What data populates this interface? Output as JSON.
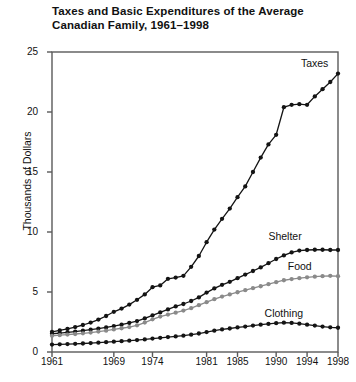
{
  "chart_data": {
    "type": "line",
    "title": "Taxes and Basic Expenditures of the Average Canadian Family, 1961–1998",
    "title_line1": "Taxes and Basic Expenditures of the Average",
    "title_line2": "Canadian Family, 1961–1998",
    "xlabel": "",
    "ylabel": "Thousands of Dollars",
    "ylim": [
      0,
      25
    ],
    "yticks": [
      0,
      5,
      10,
      15,
      20,
      25
    ],
    "xlim": [
      1961,
      1998
    ],
    "xticks": [
      1961,
      1969,
      1974,
      1981,
      1985,
      1990,
      1994,
      1998
    ],
    "xtick_labels": [
      "1961",
      "1969",
      "1974",
      "1981",
      "1985",
      "1990",
      "1994",
      "1998"
    ],
    "grid": false,
    "legend_position": "inline-right",
    "markers": "filled-circle",
    "colors": {
      "taxes": "#141414",
      "shelter": "#141414",
      "food": "#8a8a8a",
      "clothing": "#141414",
      "axis": "#5a5a5a",
      "text": "#111111"
    },
    "x": [
      1961,
      1962,
      1963,
      1964,
      1965,
      1966,
      1967,
      1968,
      1969,
      1970,
      1971,
      1972,
      1973,
      1974,
      1975,
      1976,
      1977,
      1978,
      1979,
      1980,
      1981,
      1982,
      1983,
      1984,
      1985,
      1986,
      1987,
      1988,
      1989,
      1990,
      1991,
      1992,
      1993,
      1994,
      1995,
      1996,
      1997,
      1998
    ],
    "series": [
      {
        "name": "Taxes",
        "color": "#141414",
        "label_x": 1993.2,
        "label_y": 24.0,
        "values": [
          1.68,
          1.8,
          1.92,
          2.08,
          2.25,
          2.45,
          2.7,
          3.0,
          3.35,
          3.62,
          3.95,
          4.35,
          4.8,
          5.4,
          5.55,
          6.1,
          6.2,
          6.35,
          7.1,
          8.0,
          9.15,
          10.2,
          11.1,
          11.95,
          12.9,
          13.8,
          15.0,
          16.2,
          17.3,
          18.1,
          20.4,
          20.6,
          20.65,
          20.6,
          21.3,
          21.9,
          22.5,
          23.2
        ]
      },
      {
        "name": "Shelter",
        "color": "#141414",
        "label_x": 1989.0,
        "label_y": 9.6,
        "values": [
          1.52,
          1.58,
          1.64,
          1.7,
          1.78,
          1.86,
          1.95,
          2.05,
          2.16,
          2.28,
          2.42,
          2.58,
          2.8,
          3.05,
          3.3,
          3.55,
          3.8,
          4.0,
          4.25,
          4.55,
          4.95,
          5.3,
          5.6,
          5.85,
          6.15,
          6.45,
          6.75,
          7.05,
          7.4,
          7.75,
          8.05,
          8.3,
          8.45,
          8.5,
          8.52,
          8.52,
          8.5,
          8.5
        ]
      },
      {
        "name": "Food",
        "color": "#8a8a8a",
        "label_x": 1991.5,
        "label_y": 7.1,
        "values": [
          1.35,
          1.4,
          1.45,
          1.5,
          1.56,
          1.62,
          1.7,
          1.78,
          1.88,
          1.98,
          2.08,
          2.22,
          2.45,
          2.72,
          2.95,
          3.12,
          3.28,
          3.45,
          3.65,
          3.9,
          4.15,
          4.4,
          4.62,
          4.8,
          4.98,
          5.15,
          5.32,
          5.48,
          5.65,
          5.82,
          5.98,
          6.08,
          6.15,
          6.22,
          6.28,
          6.32,
          6.35,
          6.32
        ]
      },
      {
        "name": "Clothing",
        "color": "#141414",
        "label_x": 1988.5,
        "label_y": 3.2,
        "values": [
          0.62,
          0.64,
          0.66,
          0.68,
          0.71,
          0.74,
          0.78,
          0.82,
          0.86,
          0.9,
          0.94,
          0.99,
          1.05,
          1.12,
          1.18,
          1.24,
          1.3,
          1.36,
          1.44,
          1.54,
          1.66,
          1.78,
          1.88,
          1.96,
          2.05,
          2.12,
          2.2,
          2.28,
          2.34,
          2.4,
          2.44,
          2.42,
          2.36,
          2.28,
          2.2,
          2.12,
          2.06,
          2.02
        ]
      }
    ]
  }
}
